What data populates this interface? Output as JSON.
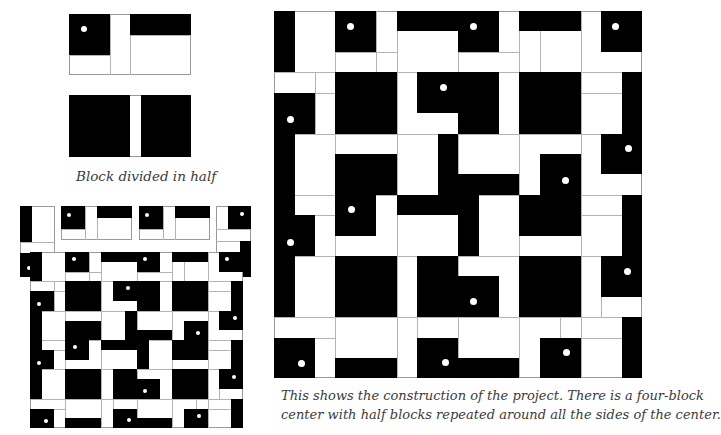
{
  "captions": {
    "half_block": "Block divided in half",
    "construction_line1": "This shows the construction of the project. There is a four-block",
    "construction_line2": "center with half blocks repeated around all the sides of the center."
  },
  "colors": {
    "fill": "#000000",
    "ground": "#ffffff",
    "line": "#9a9a9a"
  },
  "half_block_top": {
    "frame": [
      69,
      14,
      191,
      75
    ],
    "lines": [
      [
        110,
        14,
        110,
        75
      ],
      [
        130,
        14,
        130,
        75
      ],
      [
        69,
        55,
        110,
        55
      ],
      [
        130,
        35,
        191,
        35
      ]
    ],
    "black": [
      [
        69,
        14,
        110,
        55
      ],
      [
        130,
        14,
        191,
        35
      ]
    ],
    "dots": [
      [
        84,
        29,
        6
      ]
    ]
  },
  "half_block_bottom": {
    "frame": [
      69,
      95,
      191,
      157
    ],
    "lines": [],
    "black": [
      [
        69,
        95,
        130,
        157
      ],
      [
        141,
        95,
        191,
        157
      ]
    ],
    "dots": []
  },
  "construction": {
    "frame": [
      274,
      11,
      642,
      378
    ],
    "grid_x": [
      274,
      295,
      315,
      335,
      356,
      376,
      397,
      417,
      438,
      458,
      479,
      499,
      519,
      540,
      560,
      581,
      601,
      622
    ],
    "grid_y": [
      11,
      31,
      52,
      72,
      93,
      113,
      134,
      154,
      174,
      195,
      215,
      236,
      256,
      276,
      297,
      317,
      338,
      358
    ],
    "lines": [
      [
        274,
        72,
        642,
        72
      ],
      [
        274,
        134,
        642,
        134
      ],
      [
        274,
        195,
        642,
        195
      ],
      [
        274,
        256,
        642,
        256
      ],
      [
        274,
        317,
        642,
        317
      ],
      [
        335,
        11,
        335,
        378
      ],
      [
        397,
        11,
        397,
        378
      ],
      [
        458,
        11,
        458,
        378
      ],
      [
        519,
        11,
        519,
        378
      ],
      [
        581,
        11,
        581,
        378
      ],
      [
        274,
        93,
        335,
        93
      ],
      [
        581,
        93,
        642,
        93
      ],
      [
        274,
        215,
        335,
        215
      ],
      [
        581,
        215,
        642,
        215
      ],
      [
        274,
        338,
        335,
        338
      ],
      [
        581,
        338,
        642,
        338
      ],
      [
        335,
        52,
        397,
        52
      ],
      [
        458,
        52,
        519,
        52
      ],
      [
        335,
        358,
        397,
        358
      ],
      [
        458,
        358,
        519,
        358
      ],
      [
        315,
        72,
        315,
        134
      ],
      [
        601,
        256,
        601,
        317
      ],
      [
        376,
        11,
        376,
        72
      ],
      [
        540,
        11,
        540,
        72
      ],
      [
        417,
        317,
        417,
        378
      ],
      [
        560,
        317,
        560,
        378
      ]
    ],
    "black": [
      [
        274,
        11,
        295,
        72
      ],
      [
        335,
        11,
        376,
        52
      ],
      [
        397,
        11,
        458,
        31
      ],
      [
        458,
        11,
        499,
        52
      ],
      [
        519,
        11,
        581,
        31
      ],
      [
        601,
        11,
        642,
        52
      ],
      [
        274,
        93,
        315,
        134
      ],
      [
        274,
        134,
        295,
        256
      ],
      [
        335,
        72,
        397,
        134
      ],
      [
        417,
        72,
        499,
        113
      ],
      [
        458,
        113,
        499,
        134
      ],
      [
        519,
        72,
        581,
        134
      ],
      [
        622,
        72,
        642,
        174
      ],
      [
        601,
        134,
        642,
        174
      ],
      [
        335,
        154,
        397,
        195
      ],
      [
        335,
        195,
        376,
        236
      ],
      [
        438,
        134,
        458,
        215
      ],
      [
        458,
        174,
        519,
        195
      ],
      [
        397,
        195,
        438,
        215
      ],
      [
        458,
        195,
        479,
        256
      ],
      [
        540,
        154,
        581,
        195
      ],
      [
        519,
        195,
        581,
        236
      ],
      [
        622,
        195,
        642,
        297
      ],
      [
        601,
        256,
        642,
        297
      ],
      [
        274,
        215,
        315,
        256
      ],
      [
        274,
        256,
        295,
        317
      ],
      [
        335,
        256,
        397,
        317
      ],
      [
        417,
        256,
        458,
        317
      ],
      [
        458,
        276,
        499,
        317
      ],
      [
        519,
        256,
        581,
        317
      ],
      [
        274,
        338,
        315,
        378
      ],
      [
        335,
        358,
        397,
        378
      ],
      [
        417,
        338,
        458,
        378
      ],
      [
        458,
        358,
        519,
        378
      ],
      [
        540,
        338,
        581,
        378
      ],
      [
        622,
        317,
        642,
        378
      ]
    ],
    "dots": [
      [
        350,
        26,
        7
      ],
      [
        473,
        26,
        7
      ],
      [
        615,
        26,
        7
      ],
      [
        290,
        119,
        7
      ],
      [
        443,
        87,
        7
      ],
      [
        628,
        148,
        7
      ],
      [
        351,
        209,
        7
      ],
      [
        565,
        180,
        7
      ],
      [
        290,
        242,
        7
      ],
      [
        627,
        271,
        7
      ],
      [
        473,
        301,
        7
      ],
      [
        301,
        363,
        7
      ],
      [
        445,
        362,
        7
      ],
      [
        566,
        352,
        7
      ]
    ]
  },
  "exploded": {
    "pieces": [
      {
        "frame": [
          20,
          206,
          55,
          277
        ],
        "black": [
          [
            20,
            206,
            32,
            242
          ],
          [
            20,
            253,
            44,
            277
          ]
        ],
        "lines": [
          [
            20,
            242,
            55,
            242
          ],
          [
            20,
            253,
            55,
            253
          ],
          [
            44,
            253,
            44,
            277
          ]
        ],
        "dots": [
          [
            29,
            268,
            4
          ]
        ]
      },
      {
        "frame": [
          61,
          206,
          132,
          240
        ],
        "black": [
          [
            61,
            206,
            85,
            229
          ],
          [
            97,
            206,
            132,
            218
          ]
        ],
        "lines": [
          [
            85,
            206,
            85,
            240
          ],
          [
            97,
            206,
            97,
            240
          ],
          [
            61,
            229,
            85,
            229
          ]
        ],
        "dots": [
          [
            69,
            215,
            4
          ]
        ]
      },
      {
        "frame": [
          139,
          206,
          210,
          240
        ],
        "black": [
          [
            139,
            206,
            163,
            229
          ],
          [
            175,
            206,
            210,
            218
          ]
        ],
        "lines": [
          [
            163,
            206,
            163,
            240
          ],
          [
            175,
            206,
            175,
            240
          ],
          [
            139,
            229,
            163,
            229
          ]
        ],
        "dots": [
          [
            147,
            215,
            4
          ]
        ]
      },
      {
        "frame": [
          216,
          206,
          251,
          277
        ],
        "black": [
          [
            228,
            206,
            251,
            229
          ],
          [
            240,
            241,
            251,
            277
          ]
        ],
        "lines": [
          [
            216,
            229,
            251,
            229
          ],
          [
            216,
            241,
            251,
            241
          ],
          [
            228,
            206,
            228,
            229
          ]
        ],
        "dots": [
          [
            242,
            214,
            4
          ]
        ]
      }
    ],
    "grid": {
      "frame": [
        30,
        252,
        243,
        428
      ],
      "source_frame": [
        274,
        11,
        642,
        378
      ]
    }
  }
}
